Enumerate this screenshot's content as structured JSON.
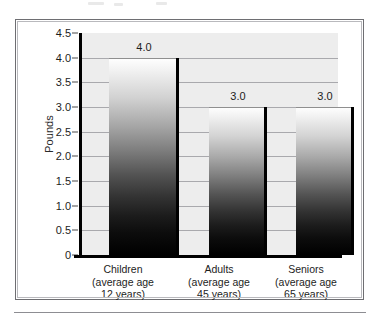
{
  "figure": {
    "frame_border_color": "#6e6e72",
    "plot_background": "#ededed",
    "gridline_color": "#a9a9ad",
    "axis_color": "#000000",
    "text_color": "#1d1d1d"
  },
  "chart_data": {
    "type": "bar",
    "title": "",
    "subtitle": "",
    "xlabel": "",
    "ylabel": "Pounds",
    "ylim": [
      0,
      4.5
    ],
    "grid": true,
    "legend": "none",
    "categories": [
      "Children\n(average age\n12 years)",
      "Adults\n(average age\n45 years)",
      "Seniors\n(average age\n65 years)"
    ],
    "category_lines": [
      [
        "Children",
        "(average age",
        "12 years)"
      ],
      [
        "Adults",
        "(average age",
        "45 years)"
      ],
      [
        "Seniors",
        "(average age",
        "65 years)"
      ]
    ],
    "values": [
      4.0,
      3.0,
      3.0
    ],
    "value_labels": [
      "4.0",
      "3.0",
      "3.0"
    ],
    "ytick_values": [
      4.5,
      4.0,
      3.5,
      3.0,
      2.5,
      2.0,
      1.5,
      1.0,
      0.5,
      0
    ],
    "ytick_labels": [
      "4.5",
      "4.0",
      "3.5",
      "3.0",
      "2.5",
      "2.0",
      "1.5",
      "1.0",
      "0.5",
      "0"
    ],
    "bar_style": {
      "fill": "vertical-gradient-white-to-black",
      "edge": "black-right-edge"
    }
  }
}
